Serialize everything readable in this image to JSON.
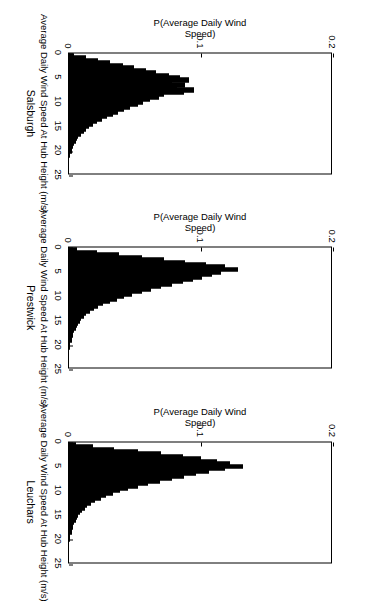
{
  "figure": {
    "kind": "multi-panel-histogram-figure",
    "orientation_note": "figure rendered sideways (rotated 90 degrees clockwise) in the screenshot",
    "background_color": "#ffffff",
    "bar_color": "#000000",
    "axis_color": "#000000"
  },
  "chart_data": [
    {
      "type": "bar",
      "title": "Salsburgh",
      "xlabel": "Average Daily Wind Speed At Hub Height (m/s)",
      "ylabel": "P(Average Daily Wind Speed)",
      "xlim": [
        0,
        25
      ],
      "ylim": [
        0,
        0.2
      ],
      "xticks": [
        0,
        5,
        10,
        15,
        20,
        25
      ],
      "xticklabels": [
        "0",
        "5",
        "10",
        "15",
        "20",
        "25"
      ],
      "yticks": [
        0,
        0.1,
        0.2
      ],
      "yticklabels": [
        "0",
        "0.1",
        "0.2"
      ],
      "grid": false,
      "legend": "none",
      "bin_width": 0.5,
      "x": [
        0.25,
        0.75,
        1.25,
        1.75,
        2.25,
        2.75,
        3.25,
        3.75,
        4.25,
        4.75,
        5.25,
        5.75,
        6.25,
        6.75,
        7.25,
        7.75,
        8.25,
        8.75,
        9.25,
        9.75,
        10.25,
        10.75,
        11.25,
        11.75,
        12.25,
        12.75,
        13.25,
        13.75,
        14.25,
        14.75,
        15.25,
        15.75,
        16.25,
        16.75,
        17.25,
        17.75,
        18.25,
        18.75,
        19.25,
        19.75,
        20.25,
        20.75,
        21.25,
        21.75,
        22.25,
        22.75,
        23.25,
        23.75,
        24.25,
        24.75
      ],
      "values": [
        0.004,
        0.013,
        0.022,
        0.031,
        0.041,
        0.049,
        0.058,
        0.066,
        0.076,
        0.084,
        0.091,
        0.078,
        0.088,
        0.082,
        0.095,
        0.087,
        0.072,
        0.068,
        0.061,
        0.056,
        0.052,
        0.046,
        0.042,
        0.037,
        0.033,
        0.029,
        0.025,
        0.021,
        0.018,
        0.015,
        0.013,
        0.011,
        0.009,
        0.007,
        0.006,
        0.005,
        0.004,
        0.003,
        0.002,
        0.002,
        0.001,
        0.001,
        0.0,
        0.0,
        0.0,
        0.0,
        0.0,
        0.0,
        0.0,
        0.0
      ]
    },
    {
      "type": "bar",
      "title": "Prestwick",
      "xlabel": "Average Daily Wind Speed At Hub Height (m/s)",
      "ylabel": "P(Average Daily Wind Speed)",
      "xlim": [
        0,
        25
      ],
      "ylim": [
        0,
        0.2
      ],
      "xticks": [
        0,
        5,
        10,
        15,
        20,
        25
      ],
      "xticklabels": [
        "0",
        "5",
        "10",
        "15",
        "20",
        "25"
      ],
      "yticks": [
        0,
        0.1,
        0.2
      ],
      "yticklabels": [
        "0",
        "0.1",
        "0.2"
      ],
      "grid": false,
      "legend": "none",
      "bin_width": 0.5,
      "x": [
        0.25,
        0.75,
        1.25,
        1.75,
        2.25,
        2.75,
        3.25,
        3.75,
        4.25,
        4.75,
        5.25,
        5.75,
        6.25,
        6.75,
        7.25,
        7.75,
        8.25,
        8.75,
        9.25,
        9.75,
        10.25,
        10.75,
        11.25,
        11.75,
        12.25,
        12.75,
        13.25,
        13.75,
        14.25,
        14.75,
        15.25,
        15.75,
        16.25,
        16.75,
        17.25,
        17.75,
        18.25,
        18.75,
        19.25,
        19.75,
        20.25,
        20.75,
        21.25,
        21.75,
        22.25,
        22.75,
        23.25,
        23.75,
        24.25,
        24.75
      ],
      "values": [
        0.006,
        0.021,
        0.038,
        0.055,
        0.072,
        0.088,
        0.104,
        0.118,
        0.128,
        0.115,
        0.108,
        0.101,
        0.094,
        0.086,
        0.078,
        0.07,
        0.062,
        0.055,
        0.048,
        0.042,
        0.036,
        0.031,
        0.026,
        0.022,
        0.019,
        0.016,
        0.013,
        0.011,
        0.009,
        0.008,
        0.007,
        0.006,
        0.005,
        0.004,
        0.003,
        0.003,
        0.002,
        0.002,
        0.001,
        0.001,
        0.001,
        0.0,
        0.0,
        0.0,
        0.0,
        0.0,
        0.0,
        0.0,
        0.0,
        0.0
      ]
    },
    {
      "type": "bar",
      "title": "Leuchars",
      "xlabel": "Average Daily Wind Speed At Hub Height (m/s)",
      "ylabel": "P(Average Daily Wind Speed)",
      "xlim": [
        0,
        25
      ],
      "ylim": [
        0,
        0.2
      ],
      "xticks": [
        0,
        5,
        10,
        15,
        20,
        25
      ],
      "xticklabels": [
        "0",
        "5",
        "10",
        "15",
        "20",
        "25"
      ],
      "yticks": [
        0,
        0.1,
        0.2
      ],
      "yticklabels": [
        "0",
        "0.1",
        "0.2"
      ],
      "grid": false,
      "legend": "none",
      "bin_width": 0.5,
      "x": [
        0.25,
        0.75,
        1.25,
        1.75,
        2.25,
        2.75,
        3.25,
        3.75,
        4.25,
        4.75,
        5.25,
        5.75,
        6.25,
        6.75,
        7.25,
        7.75,
        8.25,
        8.75,
        9.25,
        9.75,
        10.25,
        10.75,
        11.25,
        11.75,
        12.25,
        12.75,
        13.25,
        13.75,
        14.25,
        14.75,
        15.25,
        15.75,
        16.25,
        16.75,
        17.25,
        17.75,
        18.25,
        18.75,
        19.25,
        19.75,
        20.25,
        20.75,
        21.25,
        21.75,
        22.25,
        22.75,
        23.25,
        23.75,
        24.25,
        24.75
      ],
      "values": [
        0.005,
        0.018,
        0.034,
        0.052,
        0.07,
        0.086,
        0.1,
        0.112,
        0.122,
        0.132,
        0.118,
        0.106,
        0.096,
        0.087,
        0.078,
        0.069,
        0.06,
        0.052,
        0.045,
        0.039,
        0.033,
        0.028,
        0.024,
        0.02,
        0.017,
        0.014,
        0.012,
        0.01,
        0.008,
        0.007,
        0.006,
        0.005,
        0.004,
        0.003,
        0.003,
        0.002,
        0.002,
        0.001,
        0.001,
        0.001,
        0.0,
        0.0,
        0.0,
        0.0,
        0.0,
        0.0,
        0.0,
        0.0,
        0.0,
        0.0
      ]
    }
  ]
}
